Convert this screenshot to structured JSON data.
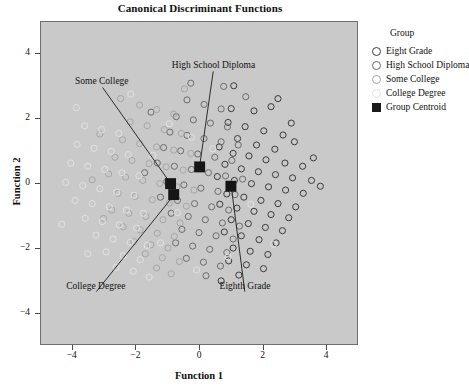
{
  "chart_data": {
    "type": "scatter",
    "title": "Canonical Discriminant Functions",
    "xlabel": "Function 1",
    "ylabel": "Function 2",
    "xlim": [
      -5.0,
      5.0
    ],
    "ylim": [
      -5.0,
      5.0
    ],
    "xticks": [
      -4,
      -2,
      0,
      2,
      4
    ],
    "yticks": [
      4,
      2,
      0,
      -2,
      -4
    ],
    "xtick_labels": [
      "−4",
      "−2",
      "0",
      "2",
      "4"
    ],
    "ytick_labels": [
      "4",
      "2",
      "0",
      "−2",
      "−4"
    ],
    "grid": false,
    "legend_position": "right",
    "plot_background": "#c9c9c9",
    "legend": {
      "title": "Group",
      "entries": [
        {
          "label": "Eight Grade",
          "marker": "open-circle",
          "color": "#3a3a3a"
        },
        {
          "label": "High School Diploma",
          "marker": "open-circle",
          "color": "#6b6b6b"
        },
        {
          "label": "Some College",
          "marker": "open-circle",
          "color": "#a5a5a5"
        },
        {
          "label": "College Degree",
          "marker": "open-circle",
          "color": "#e2e2e2"
        },
        {
          "label": "Group Centroid",
          "marker": "filled-square",
          "color": "#1a1a1a"
        }
      ]
    },
    "annotations": [
      {
        "text": "Some College",
        "tx": -3.05,
        "ty": 3.12,
        "px": -0.88,
        "py": -0.04
      },
      {
        "text": "High School Diploma",
        "tx": 0.45,
        "ty": 3.62,
        "px": 0.02,
        "py": 0.52
      },
      {
        "text": "College Degree",
        "tx": -3.25,
        "ty": -3.22,
        "px": -0.78,
        "py": -0.36
      },
      {
        "text": "Eighth Grade",
        "tx": 1.45,
        "ty": -3.22,
        "px": 1.02,
        "py": -0.1
      }
    ],
    "centroids": [
      {
        "group": "Some College",
        "x": -0.9,
        "y": -0.02
      },
      {
        "group": "College Degree",
        "x": -0.8,
        "y": -0.36
      },
      {
        "group": "Eight Grade",
        "x": 1.01,
        "y": -0.1
      },
      {
        "group": "High School Diploma",
        "x": 0.02,
        "y": 0.5
      }
    ],
    "series": [
      {
        "name": "Eight Grade",
        "color": "#3a3a3a",
        "points": [
          [
            1.02,
            2.31
          ],
          [
            1.74,
            2.24
          ],
          [
            2.28,
            2.37
          ],
          [
            0.92,
            1.88
          ],
          [
            1.46,
            1.75
          ],
          [
            2.05,
            1.62
          ],
          [
            2.66,
            1.49
          ],
          [
            3.02,
            1.28
          ],
          [
            1.22,
            1.38
          ],
          [
            1.82,
            1.18
          ],
          [
            2.4,
            1.05
          ],
          [
            0.64,
            1.12
          ],
          [
            1.08,
            0.92
          ],
          [
            1.58,
            0.84
          ],
          [
            2.12,
            0.72
          ],
          [
            2.72,
            0.62
          ],
          [
            3.28,
            0.52
          ],
          [
            0.82,
            0.58
          ],
          [
            1.34,
            0.44
          ],
          [
            1.88,
            0.35
          ],
          [
            2.42,
            0.26
          ],
          [
            2.96,
            0.16
          ],
          [
            3.56,
            0.08
          ],
          [
            0.58,
            0.2
          ],
          [
            1.12,
            0.08
          ],
          [
            1.66,
            -0.02
          ],
          [
            2.2,
            -0.12
          ],
          [
            2.74,
            -0.22
          ],
          [
            3.3,
            -0.32
          ],
          [
            0.88,
            -0.34
          ],
          [
            1.42,
            -0.44
          ],
          [
            1.96,
            -0.54
          ],
          [
            2.5,
            -0.64
          ],
          [
            3.06,
            -0.74
          ],
          [
            0.66,
            -0.66
          ],
          [
            1.2,
            -0.78
          ],
          [
            1.74,
            -0.88
          ],
          [
            2.28,
            -0.98
          ],
          [
            2.84,
            -1.08
          ],
          [
            1.02,
            -1.14
          ],
          [
            1.56,
            -1.26
          ],
          [
            2.1,
            -1.38
          ],
          [
            2.64,
            -1.48
          ],
          [
            0.8,
            -1.52
          ],
          [
            1.34,
            -1.64
          ],
          [
            1.9,
            -1.76
          ],
          [
            2.44,
            -1.86
          ],
          [
            1.08,
            -2.02
          ],
          [
            1.62,
            -2.12
          ],
          [
            2.18,
            -2.22
          ],
          [
            0.94,
            -2.42
          ],
          [
            1.5,
            -2.54
          ],
          [
            2.04,
            -2.66
          ],
          [
            1.26,
            -2.86
          ],
          [
            0.7,
            -3.04
          ],
          [
            3.84,
            -0.1
          ],
          [
            3.62,
            0.78
          ],
          [
            2.92,
            1.86
          ],
          [
            2.5,
            2.62
          ],
          [
            1.1,
            3.02
          ]
        ]
      },
      {
        "name": "High School Diploma",
        "color": "#6b6b6b",
        "points": [
          [
            -0.38,
            2.58
          ],
          [
            0.16,
            2.44
          ],
          [
            0.7,
            2.3
          ],
          [
            -0.72,
            2.06
          ],
          [
            -0.18,
            1.96
          ],
          [
            0.36,
            1.86
          ],
          [
            0.9,
            1.74
          ],
          [
            -0.92,
            1.58
          ],
          [
            -0.38,
            1.48
          ],
          [
            0.16,
            1.38
          ],
          [
            0.7,
            1.28
          ],
          [
            1.24,
            1.18
          ],
          [
            -1.12,
            1.1
          ],
          [
            -0.58,
            1.0
          ],
          [
            -0.04,
            0.9
          ],
          [
            0.5,
            0.8
          ],
          [
            1.04,
            0.7
          ],
          [
            -1.32,
            0.62
          ],
          [
            -0.78,
            0.52
          ],
          [
            -0.24,
            0.42
          ],
          [
            0.3,
            0.32
          ],
          [
            0.84,
            0.22
          ],
          [
            1.38,
            0.12
          ],
          [
            -1.02,
            0.04
          ],
          [
            -0.48,
            -0.06
          ],
          [
            0.06,
            -0.16
          ],
          [
            0.6,
            -0.26
          ],
          [
            1.14,
            -0.36
          ],
          [
            -1.22,
            -0.44
          ],
          [
            -0.68,
            -0.54
          ],
          [
            -0.14,
            -0.64
          ],
          [
            0.4,
            -0.74
          ],
          [
            0.94,
            -0.84
          ],
          [
            -0.88,
            -0.94
          ],
          [
            -0.34,
            -1.04
          ],
          [
            0.2,
            -1.14
          ],
          [
            0.74,
            -1.24
          ],
          [
            1.28,
            -1.34
          ],
          [
            -0.54,
            -1.44
          ],
          [
            0.0,
            -1.54
          ],
          [
            0.54,
            -1.64
          ],
          [
            1.08,
            -1.74
          ],
          [
            -0.74,
            -1.86
          ],
          [
            -0.2,
            -1.96
          ],
          [
            0.34,
            -2.06
          ],
          [
            0.88,
            -2.16
          ],
          [
            -0.4,
            -2.34
          ],
          [
            0.14,
            -2.46
          ],
          [
            0.68,
            -2.58
          ],
          [
            0.22,
            -2.88
          ],
          [
            -0.26,
            3.1
          ],
          [
            0.78,
            3.0
          ],
          [
            1.48,
            2.68
          ],
          [
            -1.52,
            2.2
          ],
          [
            -1.72,
            0.32
          ]
        ]
      },
      {
        "name": "Some College",
        "color": "#a5a5a5",
        "points": [
          [
            -1.88,
            2.42
          ],
          [
            -1.34,
            2.28
          ],
          [
            -0.8,
            2.14
          ],
          [
            -2.18,
            1.9
          ],
          [
            -1.64,
            1.78
          ],
          [
            -1.1,
            1.66
          ],
          [
            -0.56,
            1.54
          ],
          [
            -2.42,
            1.34
          ],
          [
            -1.88,
            1.22
          ],
          [
            -1.34,
            1.12
          ],
          [
            -0.8,
            1.02
          ],
          [
            -0.26,
            0.92
          ],
          [
            -2.66,
            0.8
          ],
          [
            -2.12,
            0.7
          ],
          [
            -1.58,
            0.6
          ],
          [
            -1.04,
            0.5
          ],
          [
            -0.5,
            0.4
          ],
          [
            -2.86,
            0.28
          ],
          [
            -2.32,
            0.18
          ],
          [
            -1.78,
            0.08
          ],
          [
            -1.24,
            -0.02
          ],
          [
            -0.7,
            -0.12
          ],
          [
            -0.16,
            -0.22
          ],
          [
            -2.56,
            -0.32
          ],
          [
            -2.02,
            -0.42
          ],
          [
            -1.48,
            -0.52
          ],
          [
            -0.94,
            -0.62
          ],
          [
            -0.4,
            -0.72
          ],
          [
            -2.76,
            -0.84
          ],
          [
            -2.22,
            -0.94
          ],
          [
            -1.68,
            -1.04
          ],
          [
            -1.14,
            -1.14
          ],
          [
            -0.6,
            -1.24
          ],
          [
            -2.4,
            -1.36
          ],
          [
            -1.86,
            -1.46
          ],
          [
            -1.32,
            -1.56
          ],
          [
            -0.78,
            -1.66
          ],
          [
            -2.06,
            -1.82
          ],
          [
            -1.52,
            -1.92
          ],
          [
            -0.98,
            -2.02
          ],
          [
            -1.7,
            -2.2
          ],
          [
            -1.16,
            -2.32
          ],
          [
            -0.62,
            -2.44
          ],
          [
            -1.34,
            -2.64
          ],
          [
            -0.88,
            -2.82
          ],
          [
            -3.14,
            1.52
          ],
          [
            -3.38,
            0.1
          ],
          [
            -3.02,
            -1.1
          ],
          [
            -2.48,
            2.62
          ],
          [
            -0.46,
            2.92
          ]
        ]
      },
      {
        "name": "College Degree",
        "color": "#e2e2e2",
        "points": [
          [
            -3.62,
            1.78
          ],
          [
            -3.08,
            1.66
          ],
          [
            -2.54,
            1.54
          ],
          [
            -3.86,
            1.2
          ],
          [
            -3.32,
            1.08
          ],
          [
            -2.78,
            0.98
          ],
          [
            -2.24,
            0.88
          ],
          [
            -4.06,
            0.62
          ],
          [
            -3.52,
            0.52
          ],
          [
            -2.98,
            0.42
          ],
          [
            -2.44,
            0.32
          ],
          [
            -1.9,
            0.22
          ],
          [
            -4.22,
            0.02
          ],
          [
            -3.68,
            -0.08
          ],
          [
            -3.14,
            -0.18
          ],
          [
            -2.6,
            -0.28
          ],
          [
            -2.06,
            -0.38
          ],
          [
            -3.92,
            -0.54
          ],
          [
            -3.38,
            -0.64
          ],
          [
            -2.84,
            -0.74
          ],
          [
            -2.3,
            -0.84
          ],
          [
            -1.76,
            -0.94
          ],
          [
            -3.6,
            -1.1
          ],
          [
            -3.06,
            -1.2
          ],
          [
            -2.52,
            -1.3
          ],
          [
            -1.98,
            -1.4
          ],
          [
            -3.26,
            -1.62
          ],
          [
            -2.72,
            -1.74
          ],
          [
            -2.18,
            -1.84
          ],
          [
            -1.64,
            -1.94
          ],
          [
            -2.94,
            -2.14
          ],
          [
            -2.4,
            -2.26
          ],
          [
            -1.86,
            -2.38
          ],
          [
            -2.62,
            -2.62
          ],
          [
            -2.08,
            -2.74
          ],
          [
            -3.88,
            2.34
          ],
          [
            -4.34,
            -1.28
          ],
          [
            -2.16,
            2.76
          ],
          [
            -1.58,
            -2.92
          ],
          [
            -3.52,
            -2.2
          ],
          [
            -0.94,
            1.84
          ],
          [
            -1.46,
            0.86
          ],
          [
            -0.68,
            -0.92
          ],
          [
            -1.22,
            -1.86
          ],
          [
            -0.24,
            1.42
          ],
          [
            0.44,
            1.06
          ],
          [
            0.92,
            -2.3
          ],
          [
            -0.08,
            -2.7
          ],
          [
            1.64,
            -0.66
          ],
          [
            2.36,
            -1.9
          ]
        ]
      }
    ]
  }
}
